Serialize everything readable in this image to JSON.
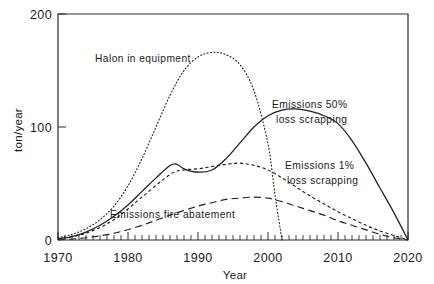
{
  "chart_data": {
    "type": "line",
    "title": "",
    "subtitle": "",
    "xlabel": "Year",
    "ylabel": "ton/year",
    "xlim": [
      1970,
      2020
    ],
    "ylim": [
      0,
      200
    ],
    "xticks": [
      1970,
      1980,
      1990,
      2000,
      2010,
      2020
    ],
    "xtick_labels": [
      "1970",
      "1980",
      "1990",
      "2000",
      "2010",
      "2020"
    ],
    "yticks": [
      0,
      100,
      200
    ],
    "ytick_labels": [
      "0",
      "100",
      "200"
    ],
    "minor_xtick_interval": 1,
    "grid": false,
    "legend_position": "inline-annotations",
    "series": [
      {
        "name": "Halon in equipment",
        "style": "dotted",
        "label": "Halon in equipment",
        "label_x": 1985,
        "label_y": 163,
        "x": [
          1970,
          1972,
          1974,
          1976,
          1978,
          1980,
          1982,
          1984,
          1986,
          1988,
          1990,
          1992,
          1994,
          1996,
          1998,
          2000,
          2001,
          2002
        ],
        "y": [
          2,
          5,
          10,
          18,
          30,
          48,
          72,
          100,
          128,
          150,
          162,
          166,
          164,
          155,
          132,
          85,
          40,
          0
        ]
      },
      {
        "name": "Emissions 50% loss scrapping",
        "style": "solid",
        "label": "Emissions 50%\nloss scrapping",
        "label_line1": "Emissions 50%",
        "label_line2": "loss scrapping",
        "label_x": 1999,
        "label_y": 112,
        "x": [
          1970,
          1972,
          1974,
          1976,
          1978,
          1980,
          1982,
          1984,
          1986,
          1987,
          1988,
          1990,
          1992,
          1994,
          1996,
          1998,
          2000,
          2002,
          2004,
          2006,
          2008,
          2010,
          2012,
          2014,
          2016,
          2018,
          2020
        ],
        "y": [
          1,
          3,
          7,
          13,
          21,
          31,
          43,
          55,
          66,
          67,
          63,
          60,
          62,
          72,
          86,
          100,
          110,
          115,
          116,
          114,
          110,
          103,
          88,
          68,
          46,
          24,
          0
        ]
      },
      {
        "name": "Emissions 1% loss scrapping",
        "style": "short-dash",
        "label": "Emissions 1%\nloss scrapping",
        "label_line1": "Emissions 1%",
        "label_line2": "loss scrapping",
        "label_x": 2001,
        "label_y": 62,
        "x": [
          1970,
          1974,
          1978,
          1982,
          1986,
          1988,
          1990,
          1992,
          1994,
          1996,
          1998,
          2000,
          2002,
          2004,
          2006,
          2008,
          2010,
          2012,
          2014,
          2016,
          2018,
          2020
        ],
        "y": [
          1,
          6,
          18,
          38,
          58,
          62,
          63,
          65,
          67,
          68,
          66,
          62,
          55,
          47,
          39,
          32,
          25,
          19,
          13,
          8,
          4,
          0
        ]
      },
      {
        "name": "Emissions fire abatement",
        "style": "long-dash",
        "label": "Emissions fire abatement",
        "label_x": 1983,
        "label_y": 22,
        "x": [
          1970,
          1974,
          1978,
          1982,
          1986,
          1990,
          1992,
          1994,
          1996,
          1998,
          2000,
          2002,
          2004,
          2006,
          2008,
          2010,
          2012,
          2014,
          2016,
          2018,
          2020
        ],
        "y": [
          0,
          2,
          6,
          13,
          22,
          30,
          33,
          36,
          37,
          38,
          37,
          34,
          30,
          26,
          22,
          17,
          13,
          9,
          5,
          2,
          0
        ]
      }
    ]
  },
  "axes": {
    "y_axis_title": "ton/year",
    "x_axis_title": "Year"
  },
  "labels": {
    "halon_in_equipment": "Halon in equipment",
    "emissions_50_line1": "Emissions 50%",
    "emissions_50_line2": "loss scrapping",
    "emissions_1_line1": "Emissions 1%",
    "emissions_1_line2": "loss scrapping",
    "emissions_fire_abatement": "Emissions fire abatement",
    "y_200": "200",
    "y_100": "100",
    "y_0": "0",
    "x_1970": "1970",
    "x_1980": "1980",
    "x_1990": "1990",
    "x_2000": "2000",
    "x_2010": "2010",
    "x_2020": "2020"
  }
}
